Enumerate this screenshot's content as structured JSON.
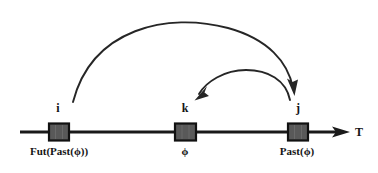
{
  "diagram": {
    "colors": {
      "stroke": "#1a1a1a",
      "box_fill": "#595959",
      "box_border": "#111111",
      "background": "#ffffff",
      "text": "#141414"
    },
    "axis": {
      "name": "time-axis",
      "label": "T",
      "label_x": 355,
      "label_y": 126,
      "line_y": 132,
      "x_start": 20,
      "x_end": 338,
      "arrow_tip_x": 350
    },
    "nodes": [
      {
        "id": "i",
        "letter": "i",
        "label": "Fut(Past(ϕ))",
        "box": {
          "x": 49,
          "y": 123,
          "w": 20,
          "h": 17
        },
        "letter_x": 58,
        "letter_y": 108,
        "label_x": 59,
        "label_y": 146
      },
      {
        "id": "k",
        "letter": "k",
        "label": "ϕ",
        "box": {
          "x": 175,
          "y": 123,
          "w": 21,
          "h": 17
        },
        "letter_x": 185,
        "letter_y": 108,
        "label_x": 185,
        "label_y": 146
      },
      {
        "id": "j",
        "letter": "j",
        "label": "Past(ϕ)",
        "box": {
          "x": 288,
          "y": 123,
          "w": 20,
          "h": 17
        },
        "letter_x": 298,
        "letter_y": 108,
        "label_x": 297,
        "label_y": 146
      }
    ],
    "arcs": [
      {
        "name": "arc-i-to-j",
        "from": "i",
        "to": "j",
        "description": "large arc from i over to j",
        "path": "M 73 102 C 92 28, 168 12, 228 28 C 268 39, 288 62, 293 88",
        "arrow_tip": {
          "x": 295,
          "y": 95
        },
        "arrow_angle": 75
      },
      {
        "name": "arc-j-to-k",
        "from": "j",
        "to": "k",
        "description": "small arc from j back to k",
        "path": "M 290 100 C 286 80, 268 70, 246 70 C 224 70, 206 82, 199 94",
        "arrow_tip": {
          "x": 195,
          "y": 100
        },
        "arrow_angle": 215
      }
    ]
  }
}
